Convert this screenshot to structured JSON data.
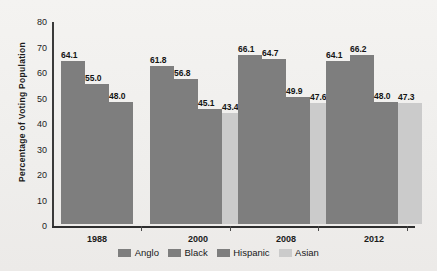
{
  "chart_data": {
    "type": "bar",
    "title": "",
    "subtitle": "",
    "xlabel": "",
    "ylabel": "Percentage of  Voting Population",
    "categories": [
      "1988",
      "2000",
      "2008",
      "2012"
    ],
    "ylim": [
      0,
      80
    ],
    "yticks": [
      "80",
      "70",
      "60",
      "50",
      "40",
      "30",
      "20",
      "10",
      "0"
    ],
    "ytick_values": [
      80,
      70,
      60,
      50,
      40,
      30,
      20,
      10,
      0
    ],
    "grid": false,
    "legend_position": "bottom",
    "series": [
      {
        "name": "Anglo",
        "color": "#7e7e7e",
        "values": [
          64.1,
          61.8,
          66.1,
          64.1
        ],
        "labels": [
          "64.1",
          "61.8",
          "66.1",
          "64.1"
        ]
      },
      {
        "name": "Black",
        "color": "#7e7e7e",
        "values": [
          55.0,
          56.8,
          64.7,
          66.2
        ],
        "labels": [
          "55.0",
          "56.8",
          "64.7",
          "66.2"
        ]
      },
      {
        "name": "Hispanic",
        "color": "#7e7e7e",
        "values": [
          48.0,
          45.1,
          49.9,
          48.0
        ],
        "labels": [
          "48.0",
          "45.1",
          "49.9",
          "48.0"
        ]
      },
      {
        "name": "Asian",
        "color": "#cbcbcb",
        "values": [
          null,
          43.4,
          47.6,
          47.3
        ],
        "labels": [
          "",
          "43.4",
          "47.6",
          "47.3"
        ]
      }
    ]
  },
  "legend": {
    "items": [
      {
        "label": "Anglo",
        "swatch": "#7e7e7e"
      },
      {
        "label": "Black",
        "swatch": "#7e7e7e"
      },
      {
        "label": "Hispanic",
        "swatch": "#7e7e7e"
      },
      {
        "label": "Asian",
        "swatch": "#cbcbcb"
      }
    ]
  },
  "colors": {
    "background": "#f1f0ee",
    "bar_dark": "#7e7e7e",
    "bar_light": "#cbcbcb",
    "axis": "#2e2e2e",
    "text": "#1b1b1b"
  }
}
